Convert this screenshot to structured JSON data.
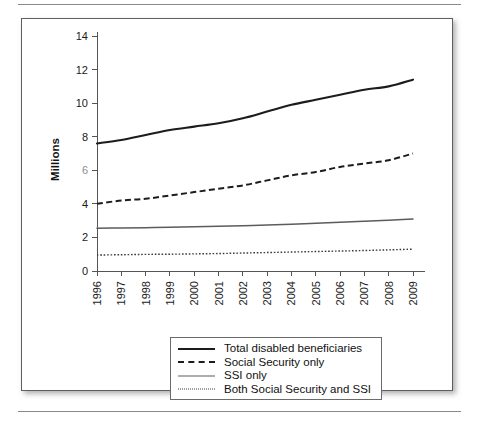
{
  "figure": {
    "frame_border_color": "#5e5e5e",
    "background_color": "#ffffff"
  },
  "axis": {
    "y_title": "Millions",
    "y_ticks": [
      "0",
      "2",
      "4",
      "6",
      "8",
      "10",
      "12",
      "14"
    ],
    "x_ticks": [
      "1996",
      "1997",
      "1998",
      "1999",
      "2000",
      "2001",
      "2002",
      "2003",
      "2004",
      "2005",
      "2006",
      "2007",
      "2008",
      "2009"
    ]
  },
  "legend": {
    "items": [
      {
        "label": "Total disabled beneficiaries",
        "style": "solid-thick",
        "color": "#1c1c1c",
        "swatch_name": "legend-swatch-total"
      },
      {
        "label": "Social Security only",
        "style": "dashed",
        "color": "#1c1c1c",
        "swatch_name": "legend-swatch-social-security-only"
      },
      {
        "label": "SSI only",
        "style": "solid-thin",
        "color": "#5c5c5c",
        "swatch_name": "legend-swatch-ssi-only"
      },
      {
        "label": "Both Social Security and SSI",
        "style": "dotted",
        "color": "#3a3a3a",
        "swatch_name": "legend-swatch-both"
      }
    ]
  },
  "chart_data": {
    "type": "line",
    "title": "",
    "xlabel": "",
    "ylabel": "Millions",
    "x": [
      1996,
      1997,
      1998,
      1999,
      2000,
      2001,
      2002,
      2003,
      2004,
      2005,
      2006,
      2007,
      2008,
      2009
    ],
    "xtick_labels": [
      "1996",
      "1997",
      "1998",
      "1999",
      "2000",
      "2001",
      "2002",
      "2003",
      "2004",
      "2005",
      "2006",
      "2007",
      "2008",
      "2009"
    ],
    "ylim": [
      0,
      14
    ],
    "yticks": [
      0,
      2,
      4,
      6,
      8,
      10,
      12,
      14
    ],
    "grid": false,
    "legend_position": "bottom-center",
    "series": [
      {
        "name": "Total disabled beneficiaries",
        "linestyle": "solid",
        "color": "#1c1c1c",
        "values": [
          7.6,
          7.8,
          8.1,
          8.4,
          8.6,
          8.8,
          9.1,
          9.5,
          9.9,
          10.2,
          10.5,
          10.8,
          11.0,
          11.4
        ]
      },
      {
        "name": "Social Security only",
        "linestyle": "dashed",
        "color": "#1c1c1c",
        "values": [
          4.0,
          4.2,
          4.3,
          4.5,
          4.7,
          4.9,
          5.1,
          5.4,
          5.7,
          5.9,
          6.2,
          6.4,
          6.6,
          7.0
        ]
      },
      {
        "name": "SSI only",
        "linestyle": "solid",
        "color": "#5c5c5c",
        "values": [
          2.55,
          2.56,
          2.58,
          2.6,
          2.63,
          2.66,
          2.7,
          2.74,
          2.79,
          2.84,
          2.9,
          2.96,
          3.02,
          3.1
        ]
      },
      {
        "name": "Both Social Security and SSI",
        "linestyle": "dotted",
        "color": "#3a3a3a",
        "values": [
          0.95,
          0.97,
          0.99,
          1.0,
          1.02,
          1.04,
          1.07,
          1.1,
          1.13,
          1.16,
          1.19,
          1.22,
          1.26,
          1.3
        ]
      }
    ]
  }
}
